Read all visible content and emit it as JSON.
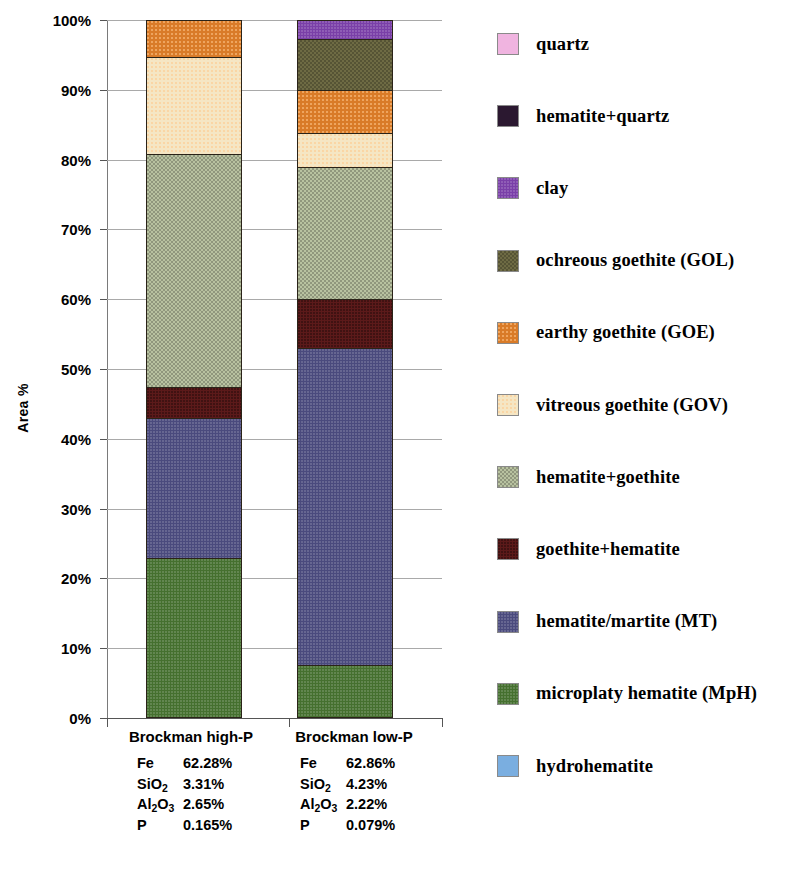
{
  "chart_data": {
    "type": "bar",
    "title": "",
    "xlabel": "",
    "ylabel": "Area %",
    "ylim": [
      0,
      100
    ],
    "grid": true,
    "stacked": true,
    "legend_position": "right",
    "y_ticks": [
      "0%",
      "10%",
      "20%",
      "30%",
      "40%",
      "50%",
      "60%",
      "70%",
      "80%",
      "90%",
      "100%"
    ],
    "y_tick_values": [
      0,
      10,
      20,
      30,
      40,
      50,
      60,
      70,
      80,
      90,
      100
    ],
    "categories": [
      "Brockman high-P",
      "Brockman low-P"
    ],
    "series": [
      {
        "name": "hydrohematite",
        "color": "#7aaee0",
        "texture": "plain",
        "values": [
          0.0,
          0.0
        ]
      },
      {
        "name": "microplaty hematite (MpH)",
        "color": "#45702f",
        "texture": "noise",
        "values": [
          22.9,
          7.6
        ]
      },
      {
        "name": "hematite/martite (MT)",
        "color": "#4a4a7d",
        "texture": "noise",
        "values": [
          20.1,
          45.4
        ]
      },
      {
        "name": "goethite+hematite",
        "color": "#5c1a1a",
        "texture": "dots-dark",
        "values": [
          4.4,
          7.0
        ]
      },
      {
        "name": "hematite+goethite",
        "color": "#b8c2a0",
        "texture": "check-dark",
        "values": [
          33.4,
          19.0
        ]
      },
      {
        "name": "vitreous goethite (GOV)",
        "color": "#f5e6c4",
        "texture": "speckle",
        "values": [
          13.9,
          4.8
        ]
      },
      {
        "name": "earthy goethite (GOE)",
        "color": "#d97b28",
        "texture": "speckle",
        "values": [
          5.3,
          6.2
        ]
      },
      {
        "name": "ochreous goethite (GOL)",
        "color": "#6e6b44",
        "texture": "check-dark",
        "values": [
          0.0,
          7.3
        ]
      },
      {
        "name": "clay",
        "color": "#7a3fa8",
        "texture": "noise",
        "values": [
          0.0,
          2.7
        ]
      },
      {
        "name": "hematite+quartz",
        "color": "#2b1830",
        "texture": "plain",
        "values": [
          0.0,
          0.0
        ]
      },
      {
        "name": "quartz",
        "color": "#f0b4e0",
        "texture": "plain",
        "values": [
          0.0,
          0.0
        ]
      }
    ]
  },
  "axis": {
    "y_title": "Area %"
  },
  "legend": {
    "items": [
      {
        "label": "quartz",
        "color": "#f0b4e0",
        "texture": "plain"
      },
      {
        "label": "hematite+quartz",
        "color": "#2b1830",
        "texture": "plain"
      },
      {
        "label": "clay",
        "color": "#7a3fa8",
        "texture": "noise"
      },
      {
        "label": "ochreous goethite (GOL)",
        "color": "#6e6b44",
        "texture": "check-dark"
      },
      {
        "label": "earthy goethite (GOE)",
        "color": "#d97b28",
        "texture": "speckle"
      },
      {
        "label": "vitreous goethite (GOV)",
        "color": "#f5e6c4",
        "texture": "speckle"
      },
      {
        "label": "hematite+goethite",
        "color": "#b8c2a0",
        "texture": "check-dark"
      },
      {
        "label": "goethite+hematite",
        "color": "#5c1a1a",
        "texture": "dots-dark"
      },
      {
        "label": "hematite/martite (MT)",
        "color": "#4a4a7d",
        "texture": "noise"
      },
      {
        "label": "microplaty hematite (MpH)",
        "color": "#45702f",
        "texture": "noise"
      },
      {
        "label": "hydrohematite",
        "color": "#7aaee0",
        "texture": "plain"
      }
    ]
  },
  "categories": [
    {
      "name": "Brockman high-P",
      "assay": [
        {
          "symbol": "Fe",
          "symbol_html": "Fe",
          "value": "62.28%"
        },
        {
          "symbol": "SiO2",
          "symbol_html": "SiO<sub>2</sub>",
          "value": "3.31%"
        },
        {
          "symbol": "Al2O3",
          "symbol_html": "Al<sub>2</sub>O<sub>3</sub>",
          "value": "2.65%"
        },
        {
          "symbol": "P",
          "symbol_html": "P",
          "value": "0.165%"
        }
      ]
    },
    {
      "name": "Brockman low-P",
      "assay": [
        {
          "symbol": "Fe",
          "symbol_html": "Fe",
          "value": "62.86%"
        },
        {
          "symbol": "SiO2",
          "symbol_html": "SiO<sub>2</sub>",
          "value": "4.23%"
        },
        {
          "symbol": "Al2O3",
          "symbol_html": "Al<sub>2</sub>O<sub>3</sub>",
          "value": "2.22%"
        },
        {
          "symbol": "P",
          "symbol_html": "P",
          "value": "0.079%"
        }
      ]
    }
  ]
}
